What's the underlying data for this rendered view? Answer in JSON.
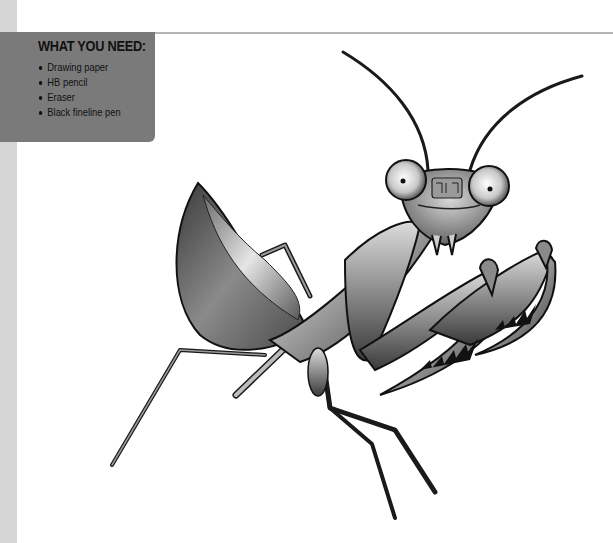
{
  "materials_box": {
    "title": "WHAT YOU NEED:",
    "items": [
      "Drawing paper",
      "HB pencil",
      "Eraser",
      "Black fineline pen"
    ]
  },
  "illustration": {
    "subject": "praying mantis",
    "style": "grayscale pencil shading"
  },
  "colors": {
    "box_background": "#7a7a7a",
    "left_strip": "#d6d6d6",
    "rule": "#b4b4b4"
  }
}
